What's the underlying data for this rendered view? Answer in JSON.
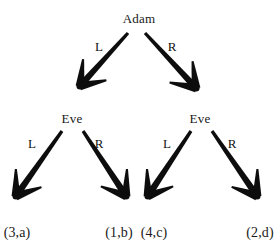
{
  "figure": {
    "type": "extensive-form-game-tree",
    "width": 279,
    "height": 245,
    "background_color": "#ffffff",
    "ink_color": "#0d0d0d"
  },
  "nodes": [
    {
      "id": "root",
      "label": "Adam",
      "x": 139,
      "y": 12,
      "anchor": "middle"
    },
    {
      "id": "eve-left",
      "label": "Eve",
      "x": 72,
      "y": 112,
      "anchor": "middle"
    },
    {
      "id": "eve-right",
      "label": "Eve",
      "x": 200,
      "y": 112,
      "anchor": "middle"
    }
  ],
  "edges": [
    {
      "id": "root-L",
      "action": "L",
      "from": "root",
      "to": "eve-left",
      "label_x": 99,
      "label_y": 40,
      "x1": 128,
      "y1": 33,
      "x2": 80,
      "y2": 86
    },
    {
      "id": "root-R",
      "action": "R",
      "from": "root",
      "to": "eve-right",
      "label_x": 172,
      "label_y": 40,
      "x1": 145,
      "y1": 33,
      "x2": 196,
      "y2": 88
    },
    {
      "id": "evel-L",
      "action": "L",
      "from": "eve-left",
      "to": "payoff-3a",
      "label_x": 32,
      "label_y": 137,
      "x1": 62,
      "y1": 131,
      "x2": 16,
      "y2": 196
    },
    {
      "id": "evel-R",
      "action": "R",
      "from": "eve-left",
      "to": "payoff-1b",
      "label_x": 99,
      "label_y": 137,
      "x1": 83,
      "y1": 131,
      "x2": 126,
      "y2": 196
    },
    {
      "id": "ever-L",
      "action": "L",
      "from": "eve-right",
      "to": "payoff-4c",
      "label_x": 167,
      "label_y": 137,
      "x1": 191,
      "y1": 131,
      "x2": 148,
      "y2": 196
    },
    {
      "id": "ever-R",
      "action": "R",
      "from": "eve-right",
      "to": "payoff-2d",
      "label_x": 232,
      "label_y": 137,
      "x1": 212,
      "y1": 131,
      "x2": 257,
      "y2": 196
    }
  ],
  "payoffs": [
    {
      "id": "payoff-3a",
      "label": "(3,a)",
      "x": 17,
      "y": 226,
      "anchor": "middle"
    },
    {
      "id": "payoff-1b",
      "label": "(1,b)",
      "x": 119,
      "y": 226,
      "anchor": "middle"
    },
    {
      "id": "payoff-4c",
      "label": "(4,c)",
      "x": 154,
      "y": 226,
      "anchor": "middle"
    },
    {
      "id": "payoff-2d",
      "label": "(2,d)",
      "x": 260,
      "y": 226,
      "anchor": "middle"
    }
  ]
}
